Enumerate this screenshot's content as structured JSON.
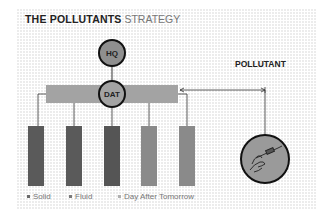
{
  "title": {
    "bold": "THE POLLUTANTS",
    "light": "STRATEGY"
  },
  "nodes": {
    "hq": {
      "label": "HQ",
      "color": "#8f8f8f"
    },
    "dat": {
      "label": "DAT",
      "color": "#a3a3a3"
    },
    "pollutant": {
      "label": "POLLUTANT",
      "icon": "hand-with-syringe-icon",
      "color": "#9a9a9a"
    }
  },
  "bars": [
    {
      "category": "Solid",
      "color": "#5a5a5a"
    },
    {
      "category": "Solid",
      "color": "#5a5a5a"
    },
    {
      "category": "Fluid",
      "color": "#555555"
    },
    {
      "category": "Day After Tomorrow",
      "color": "#8a8a8a"
    },
    {
      "category": "Day After Tomorrow",
      "color": "#8a8a8a"
    }
  ],
  "legend": [
    {
      "label": "Solid",
      "color": "#6a6a6a"
    },
    {
      "label": "Fluid",
      "color": "#7a7a7a"
    },
    {
      "label": "Day After Tomorrow",
      "color": "#b0b0b0"
    }
  ]
}
